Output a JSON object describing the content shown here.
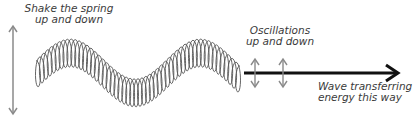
{
  "diagram": {
    "type": "transverse-wave-on-spring",
    "labels": {
      "shake_line1": "Shake the spring",
      "shake_line2": "up and down",
      "oscillations_line1": "Oscillations",
      "oscillations_line2": "up and down",
      "wave_line1": "Wave transferring",
      "wave_line2": "energy this way"
    },
    "colors": {
      "spring": "#555555",
      "grey_arrow": "#8a8a8a",
      "direction_arrow": "#111111",
      "text": "#3a3a3a"
    }
  }
}
